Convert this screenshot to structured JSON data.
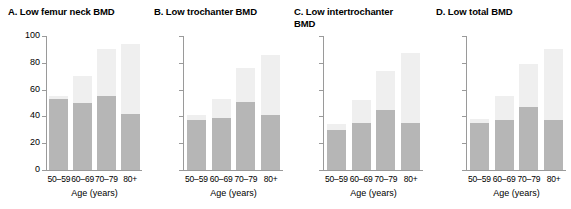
{
  "chart_data": {
    "type": "bar",
    "title": "",
    "xlabel": "Age (years)",
    "ylabel": "Percent",
    "ylim": [
      0,
      100
    ],
    "yticks": [
      0,
      20,
      40,
      60,
      80,
      100
    ],
    "categories": [
      "50–59",
      "60–69",
      "70–79",
      "80+"
    ],
    "grid": false,
    "legend": "none",
    "stacked": true,
    "colors": {
      "lower_segment": "#b6b6b6",
      "upper_segment": "#efefef",
      "axis": "#9a9a9a",
      "text": "#000000",
      "background": "#ffffff"
    },
    "panels": [
      {
        "label": "A",
        "title": "A. Low femur neck BMD",
        "series": [
          {
            "name": "lower",
            "values": [
              53,
              50,
              55,
              42
            ]
          },
          {
            "name": "upper_total",
            "values": [
              55,
              70,
              90,
              94
            ]
          }
        ]
      },
      {
        "label": "B",
        "title": "B. Low trochanter BMD",
        "series": [
          {
            "name": "lower",
            "values": [
              37,
              39,
              51,
              41
            ]
          },
          {
            "name": "upper_total",
            "values": [
              41,
              53,
              76,
              86
            ]
          }
        ]
      },
      {
        "label": "C",
        "title": "C. Low intertrochanter\n    BMD",
        "series": [
          {
            "name": "lower",
            "values": [
              30,
              35,
              45,
              35
            ]
          },
          {
            "name": "upper_total",
            "values": [
              34,
              52,
              74,
              87
            ]
          }
        ]
      },
      {
        "label": "D",
        "title": "D. Low total BMD",
        "series": [
          {
            "name": "lower",
            "values": [
              35,
              37,
              47,
              37
            ]
          },
          {
            "name": "upper_total",
            "values": [
              38,
              55,
              79,
              90
            ]
          }
        ]
      }
    ]
  }
}
